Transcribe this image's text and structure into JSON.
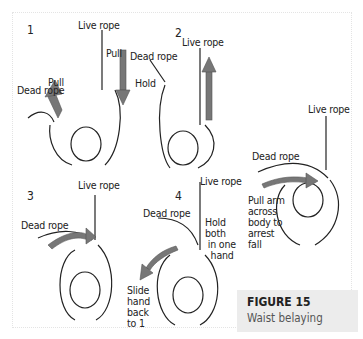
{
  "figure": {
    "title": "FIGURE 15",
    "subtitle": "Waist belaying"
  },
  "panels": [
    {
      "number": "1",
      "labels": {
        "live": "Live rope",
        "dead": "Dead rope",
        "pull_left": "Pull",
        "pull_right": "Pull"
      }
    },
    {
      "number": "2",
      "labels": {
        "live": "Live rope",
        "dead": "Dead rope",
        "hold": "Hold"
      }
    },
    {
      "number": "3",
      "labels": {
        "live": "Live rope",
        "dead": "Dead rope"
      }
    },
    {
      "number": "4",
      "labels": {
        "live": "Live rope",
        "dead": "Dead rope",
        "hold": "Hold\nboth\n in one\n  hand",
        "slide": "Slide\nhand\nback\nto 1"
      }
    },
    {
      "number": "",
      "labels": {
        "live": "Live rope",
        "dead": "Dead rope",
        "arrest": "Pull arm\nacross\nbody to\narrest\nfall"
      }
    }
  ],
  "colors": {
    "arrow": "#777777",
    "line": "#222222",
    "caption_bg": "#ececec"
  }
}
